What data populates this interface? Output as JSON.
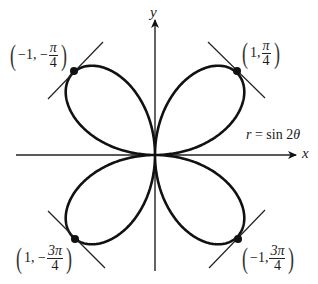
{
  "diagram": {
    "equation_label": {
      "lhs": "r",
      "rhs": "= sin 2",
      "var": "θ"
    },
    "axes": {
      "x_label": "x",
      "y_label": "y",
      "origin_px": [
        155,
        155
      ],
      "x_range_px": [
        16,
        296
      ],
      "y_range_px": [
        20,
        271
      ]
    },
    "curve": {
      "type": "polar-rose",
      "equation": "r = sin 2θ",
      "scale_px": 116,
      "stroke": "#111111",
      "stroke_width": 2.6
    },
    "points": [
      {
        "id": "upper-left",
        "label_prefix": "−1, −",
        "num": "π",
        "den": "4",
        "dot_px": [
          74,
          71
        ],
        "tangent_px": [
          [
            48,
            99
          ],
          [
            103,
            42
          ]
        ],
        "label_pos": [
          8,
          40
        ]
      },
      {
        "id": "upper-right",
        "label_prefix": "1, ",
        "num": "π",
        "den": "4",
        "dot_px": [
          237,
          71
        ],
        "tangent_px": [
          [
            208,
            42
          ],
          [
            265,
            98
          ]
        ],
        "label_pos": [
          240,
          38
        ]
      },
      {
        "id": "lower-left",
        "label_prefix": "1, −",
        "num": "3π",
        "den": "4",
        "dot_px": [
          75,
          239
        ],
        "tangent_px": [
          [
            48,
            211
          ],
          [
            105,
            268
          ]
        ],
        "label_pos": [
          14,
          243
        ]
      },
      {
        "id": "lower-right",
        "label_prefix": "−1, ",
        "num": "3π",
        "den": "4",
        "dot_px": [
          238,
          239
        ],
        "tangent_px": [
          [
            209,
            268
          ],
          [
            265,
            210
          ]
        ],
        "label_pos": [
          240,
          243
        ]
      }
    ],
    "colors": {
      "line": "#111111",
      "tangent": "#222222",
      "text": "#1a1a1a",
      "background": "#ffffff"
    }
  }
}
